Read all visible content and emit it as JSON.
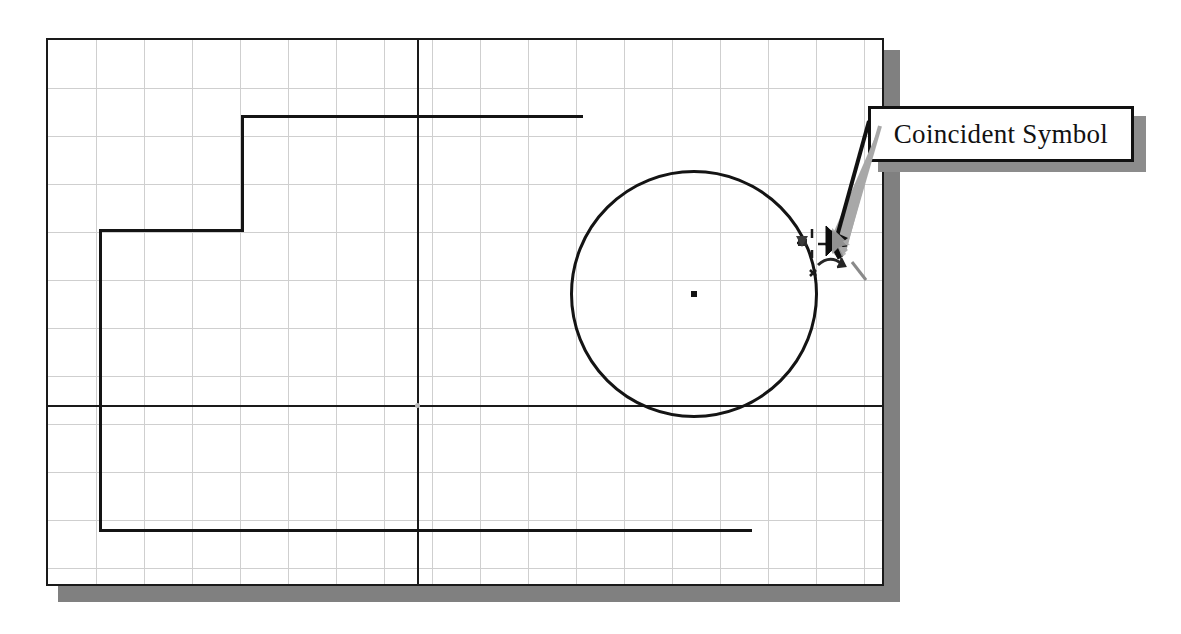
{
  "canvas": {
    "width": 1181,
    "height": 634,
    "background": "#ffffff"
  },
  "sketch_window": {
    "name": "sketch-drawing-area",
    "left": 46,
    "top": 38,
    "width": 838,
    "height": 548,
    "border_color": "#1a1a1a",
    "shadow_color": "#808080",
    "grid": {
      "visible": true,
      "spacing": 48,
      "color": "#cfcfcf",
      "vertical_count": 17,
      "horizontal_count": 11
    }
  },
  "geometry": {
    "line_color": "#141414",
    "centerlines": {
      "horizontal_y": 403,
      "vertical_x": 415,
      "color": "#1a1a1a"
    },
    "origin_point": {
      "x": 415,
      "y": 403
    },
    "profile_segments": [
      {
        "name": "top-horizontal",
        "x1": 239,
        "y1": 113,
        "x2": 578,
        "y2": 113
      },
      {
        "name": "step-vertical",
        "x1": 239,
        "y1": 113,
        "x2": 239,
        "y2": 227
      },
      {
        "name": "step-horizontal",
        "x1": 97,
        "y1": 227,
        "x2": 239,
        "y2": 227
      },
      {
        "name": "left-vertical",
        "x1": 97,
        "y1": 227,
        "x2": 97,
        "y2": 527
      },
      {
        "name": "bottom-horizontal",
        "x1": 97,
        "y1": 527,
        "x2": 747,
        "y2": 527
      }
    ],
    "circle": {
      "name": "sketched-circle",
      "center_x": 692,
      "center_y": 292,
      "radius": 124,
      "center_point_visible": true
    }
  },
  "cursor": {
    "name": "sketch-cursor",
    "x": 826,
    "y": 243,
    "tool": "circle-tool",
    "constraint_symbol": "coincident",
    "symbol_x": 812,
    "symbol_y": 240
  },
  "callout": {
    "name": "coincident-symbol-callout",
    "label": "Coincident Symbol",
    "box_left": 868,
    "box_top": 106,
    "box_width": 266,
    "box_height": 56,
    "border_color": "#111111",
    "fill_color": "#ffffff",
    "shadow_color": "#8c8c8c",
    "leader": {
      "from_x": 868,
      "from_y": 122,
      "to_x": 832,
      "to_y": 248,
      "color": "#111111",
      "shadow_color": "#a8a8a8"
    }
  }
}
